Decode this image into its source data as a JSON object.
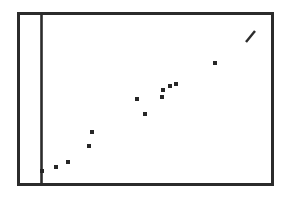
{
  "figure": {
    "name": "scatter-plot-figure",
    "background_color": "#ffffff",
    "ink_color": "#2b2b2b",
    "point_color": "#262626"
  },
  "frame": {
    "x": 18.5,
    "y": 13.5,
    "width": 254,
    "height": 171,
    "stroke_width": 3,
    "color": "#2b2b2b"
  },
  "axis": {
    "name": "vertical-axis-line",
    "x": 41.5,
    "y_top": 13.5,
    "y_bottom": 184.5,
    "stroke_width": 2.6,
    "color": "#2b2b2b"
  },
  "chart_data": {
    "type": "scatter",
    "title": "",
    "subtitle": "",
    "xlabel": "",
    "ylabel": "",
    "grid": false,
    "legend": null,
    "axis_ranges": {
      "xlim": [
        0,
        254
      ],
      "ylim": [
        0,
        171
      ]
    },
    "marker": {
      "shape": "square",
      "size_px": 4,
      "color": "#262626"
    },
    "point_count": 12,
    "points_pixel": [
      {
        "x": 42,
        "y": 171
      },
      {
        "x": 56,
        "y": 167
      },
      {
        "x": 68,
        "y": 162
      },
      {
        "x": 89,
        "y": 146
      },
      {
        "x": 92,
        "y": 132
      },
      {
        "x": 137,
        "y": 99
      },
      {
        "x": 145,
        "y": 114
      },
      {
        "x": 162,
        "y": 97
      },
      {
        "x": 163,
        "y": 90
      },
      {
        "x": 170,
        "y": 86
      },
      {
        "x": 176,
        "y": 84
      },
      {
        "x": 215,
        "y": 63
      }
    ],
    "x": [
      42,
      56,
      68,
      89,
      92,
      137,
      145,
      162,
      163,
      170,
      176,
      215
    ],
    "y": [
      171,
      167,
      162,
      146,
      132,
      99,
      114,
      97,
      90,
      86,
      84,
      63
    ],
    "trend": "increasing",
    "annotations": [
      {
        "name": "diagonal-dash-mark",
        "type": "line-segment",
        "x1": 246,
        "y1": 42,
        "x2": 255,
        "y2": 31,
        "stroke_width": 2.4,
        "color": "#2b2b2b"
      }
    ]
  }
}
